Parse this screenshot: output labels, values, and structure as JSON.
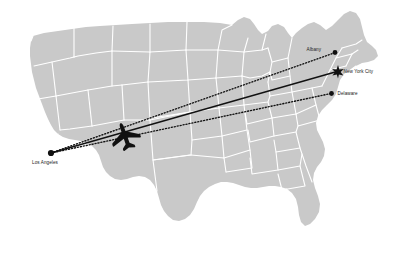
{
  "figure": {
    "type": "route-map",
    "region": "Contiguous United States",
    "background_color": "#ffffff",
    "land_color": "#c9c9c9",
    "border_color": "#ffffff",
    "route_color": "#111111",
    "label_color": "#1a1a1a"
  },
  "markers": [
    {
      "id": "albany",
      "label": "Albany",
      "shape": "dot",
      "x": 335.0,
      "y": 52.5
    },
    {
      "id": "new_york",
      "label": "New York City",
      "shape": "star",
      "x": 338.0,
      "y": 71.5
    },
    {
      "id": "delaware",
      "label": "Delaware",
      "shape": "dot",
      "x": 331.5,
      "y": 93.5
    },
    {
      "id": "los_angeles",
      "label": "Los Angeles",
      "shape": "dot",
      "x": 51.0,
      "y": 153.0
    }
  ],
  "routes": [
    {
      "id": "route-albany",
      "style": "dotted",
      "from": "los_angeles",
      "to": "albany"
    },
    {
      "id": "route-new-york",
      "style": "solid",
      "from": "los_angeles",
      "to": "new_york"
    },
    {
      "id": "route-delaware",
      "style": "dotted",
      "from": "los_angeles",
      "to": "delaware"
    }
  ],
  "aircraft": {
    "name": "airplane-silhouette",
    "heading": "east",
    "x": 125.0,
    "y": 136.0
  }
}
